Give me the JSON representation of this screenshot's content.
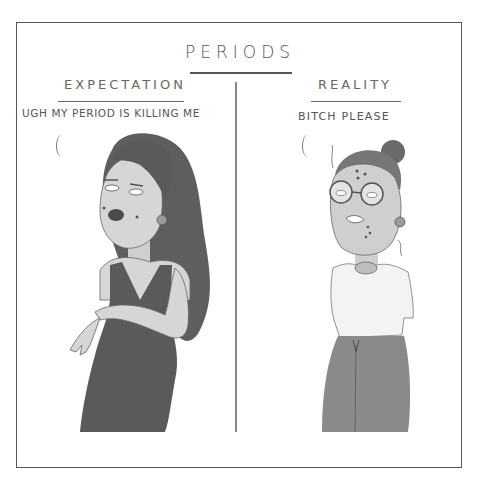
{
  "comic": {
    "title": "PERIODS",
    "panels": [
      {
        "heading": "EXPECTATION",
        "speech": "UGH MY PERIOD IS KILLING ME",
        "character": "glamorous woman with long dark hair, dark lipstick, beauty marks, round earring, dark fitted tank dress"
      },
      {
        "heading": "REALITY",
        "speech": "BITCH PLEASE",
        "character": "woman with messy hair bun, round glasses, pimples, flyaway hairs, round earring, white t-shirt, gray sweatpants"
      }
    ]
  },
  "colors": {
    "ink": "#555555",
    "dark_fill": "#5a5a5a",
    "mid_fill": "#8a8a8a",
    "light_fill": "#d9d9d9",
    "background": "#ffffff"
  }
}
